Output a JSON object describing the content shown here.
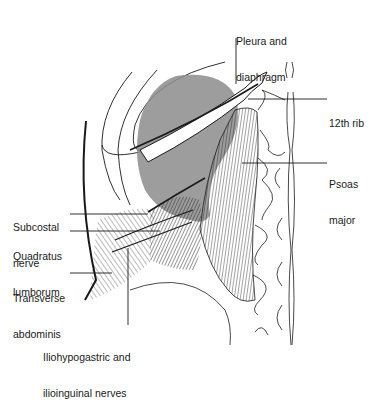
{
  "figure": {
    "colors": {
      "ink": "#1a1a1a",
      "pleura_shade": "#8c8c8c",
      "background": "#ffffff"
    },
    "labels": [
      {
        "id": "pleura",
        "line1": "Pleura and",
        "line2": "diaphragm"
      },
      {
        "id": "rib12",
        "line1": "12th rib",
        "line2": ""
      },
      {
        "id": "psoas",
        "line1": "Psoas",
        "line2": "major"
      },
      {
        "id": "subcostal",
        "line1": "Subcostal",
        "line2": "nerve"
      },
      {
        "id": "quadratus",
        "line1": "Quadratus",
        "line2": "lumborum"
      },
      {
        "id": "transverse",
        "line1": "Transverse",
        "line2": "abdominis"
      },
      {
        "id": "ilio",
        "line1": "Iliohypogastric and",
        "line2": "ilioinguinal nerves"
      }
    ]
  }
}
